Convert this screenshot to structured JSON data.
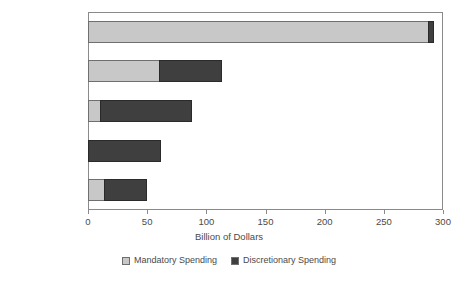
{
  "chart_data": {
    "type": "bar",
    "orientation": "horizontal",
    "stacked": true,
    "title": "",
    "xlabel": "Billion of Dollars",
    "ylabel": "",
    "xlim": [
      0,
      300
    ],
    "xticks": [
      0,
      50,
      100,
      150,
      200,
      250,
      300
    ],
    "xticklabels": [
      "0",
      "50",
      "100",
      "150",
      "200",
      "250",
      "300"
    ],
    "grid": false,
    "legend_position": "bottom",
    "categories": [
      "Health",
      "Income Security",
      "Education",
      "Transportation",
      "Other"
    ],
    "series": [
      {
        "name": "Mandatory Spending",
        "color": "#c8c8c8",
        "values": [
          288,
          61,
          11,
          0,
          14
        ]
      },
      {
        "name": "Discretionary Spending",
        "color": "#3f3f3f",
        "values": [
          5,
          53,
          78,
          62,
          37
        ]
      }
    ],
    "totals": [
      293,
      114,
      89,
      62,
      51
    ]
  },
  "axis": {
    "x_title": "Billion of Dollars"
  },
  "legend": {
    "items": [
      {
        "label": "Mandatory Spending",
        "color": "#c8c8c8"
      },
      {
        "label": "Discretionary Spending",
        "color": "#3f3f3f"
      }
    ]
  },
  "colors": {
    "mandatory": "#c8c8c8",
    "discretionary": "#3f3f3f",
    "frame": "#8a8a8a",
    "text": "#4a4a4a",
    "background": "#ffffff"
  }
}
